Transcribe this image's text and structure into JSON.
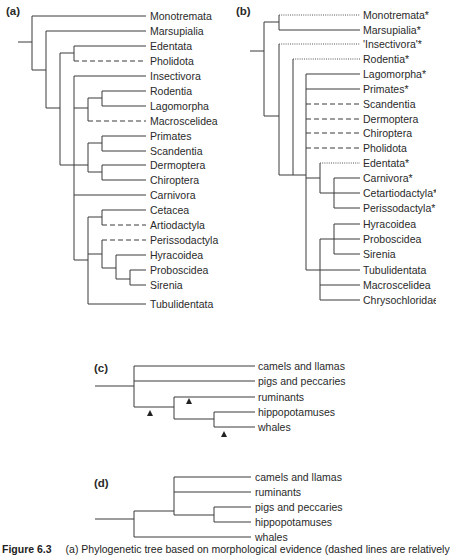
{
  "panels": {
    "a": {
      "label": "(a)",
      "taxa": [
        "Monotremata",
        "Marsupialia",
        "Edentata",
        "Pholidota",
        "Insectivora",
        "Rodentia",
        "Lagomorpha",
        "Macroscelidea",
        "Primates",
        "Scandentia",
        "Dermoptera",
        "Chiroptera",
        "Carnivora",
        "Cetacea",
        "Artiodactyla",
        "Perissodactyla",
        "Hyracoidea",
        "Proboscidea",
        "Sirenia",
        "Tubulidentata"
      ],
      "dashed_taxa": [
        "Pholidota",
        "Macroscelidea",
        "Artiodactyla",
        "Perissodactyla"
      ]
    },
    "b": {
      "label": "(b)",
      "taxa": [
        "Monotremata*",
        "Marsupialia*",
        "'Insectivora'*",
        "Rodentia*",
        "Lagomorpha*",
        "Primates*",
        "Scandentia",
        "Dermoptera",
        "Chiroptera",
        "Pholidota",
        "Edentata*",
        "Carnivora*",
        "Cetartiodactyla*",
        "Perissodactyla*",
        "Hyracoidea",
        "Proboscidea",
        "Sirenia",
        "Tubulidentata",
        "Macroscelidea",
        "Chrysochloridae"
      ],
      "dashed_taxa": [
        "Scandentia",
        "Dermoptera",
        "Chiroptera",
        "Pholidota"
      ],
      "dotted_taxa": [
        "Monotremata*",
        "'Insectivora'*",
        "Rodentia*",
        "Edentata*"
      ]
    },
    "c": {
      "label": "(c)",
      "taxa": [
        "camels and llamas",
        "pigs and peccaries",
        "ruminants",
        "hippopotamuses",
        "whales"
      ],
      "markers": "triangle"
    },
    "d": {
      "label": "(d)",
      "taxa": [
        "camels and llamas",
        "ruminants",
        "pigs and peccaries",
        "hippopotamuses",
        "whales"
      ]
    }
  },
  "caption": {
    "figure": "Figure 6.3",
    "text": "(a) Phylogenetic tree based on morphological evidence (dashed lines are relatively"
  }
}
